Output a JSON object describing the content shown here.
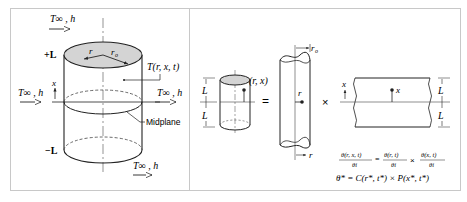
{
  "left_panel": {
    "labels": {
      "t_inf_h_top": "T∞ , h",
      "t_inf_h_left": "T∞ , h",
      "t_inf_h_right": "T∞ , h",
      "t_inf_h_bottom": "T∞ , h",
      "plus_L": "+L",
      "minus_L": "−L",
      "r": "r",
      "r_o": "r",
      "r_o_sub": "o",
      "x": "x",
      "temperature": "T(r, x, t)",
      "midplane": "Midplane"
    }
  },
  "right_panel": {
    "labels": {
      "point": "(r, x)",
      "L_upper": "L",
      "L_lower": "L",
      "equals": "=",
      "times": "×",
      "r_o": "r",
      "r_o_sub": "o",
      "r_point": "r",
      "r_axis": "r",
      "x_axis": "x",
      "x_point": "x",
      "L_wall_upper": "L",
      "L_wall_lower": "L"
    },
    "equation": {
      "lhs_num": "θ(r, x, t)",
      "lhs_den": "θi",
      "eq": "=",
      "r_num": "θ(r, t)",
      "r_den": "θi",
      "times": "×",
      "x_num": "θ(x, t)",
      "x_den": "θi",
      "line2": "θ* = C(r*, t*) × P(x*, t*)"
    }
  },
  "colors": {
    "line": "#222222",
    "fill_top": "#d4d4d4",
    "frame": "#c8c8c8",
    "center": "#666666"
  }
}
